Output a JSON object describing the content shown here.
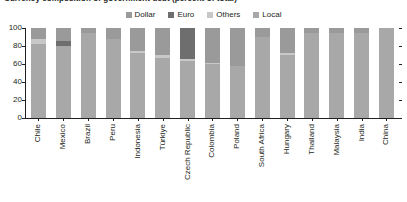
{
  "chart_title": "Currency composition of government debt (percent of total)",
  "legend": {
    "position": "top-center",
    "items": [
      {
        "label": "Dollar",
        "color": "#9a9a9a"
      },
      {
        "label": "Euro",
        "color": "#6e6e6e"
      },
      {
        "label": "Others",
        "color": "#c8c8c8"
      },
      {
        "label": "Local",
        "color": "#a8a8a8"
      }
    ]
  },
  "axes": {
    "yticks": [
      0,
      20,
      40,
      60,
      80,
      100
    ],
    "ylim": [
      0,
      100
    ],
    "ylabel": "",
    "xlabel": "",
    "grid": false
  },
  "chart_data": {
    "type": "bar",
    "title": "Currency composition of government debt (percent of total)",
    "subtype": "stacked-100-percent",
    "xlabel": "",
    "ylabel": "",
    "ylim": [
      0,
      100
    ],
    "yticks": [
      0,
      20,
      40,
      60,
      80,
      100
    ],
    "grid": false,
    "legend_position": "top-center",
    "stack_order_bottom_to_top": [
      "Local",
      "Others",
      "Euro",
      "Dollar"
    ],
    "categories": [
      "Chile",
      "Mexico",
      "Brazil",
      "Peru",
      "Indonesia",
      "Türkiye",
      "Czech Republic",
      "Colombia",
      "Poland",
      "South Africa",
      "Hungary",
      "Thailand",
      "Malaysia",
      "India",
      "China"
    ],
    "series": [
      {
        "name": "Local",
        "color": "#a8a8a8",
        "values": [
          82,
          80,
          95,
          88,
          72,
          67,
          63,
          60,
          58,
          90,
          70,
          95,
          94,
          95,
          100
        ]
      },
      {
        "name": "Others",
        "color": "#c8c8c8",
        "values": [
          6,
          0,
          0,
          0,
          2,
          3,
          3,
          1,
          0,
          0,
          2,
          0,
          0,
          0,
          0
        ]
      },
      {
        "name": "Euro",
        "color": "#6e6e6e",
        "values": [
          0,
          6,
          0,
          0,
          0,
          0,
          34,
          0,
          0,
          0,
          0,
          0,
          0,
          0,
          0
        ]
      },
      {
        "name": "Dollar",
        "color": "#9a9a9a",
        "values": [
          12,
          14,
          5,
          12,
          26,
          30,
          0,
          39,
          42,
          10,
          28,
          5,
          6,
          5,
          0
        ]
      }
    ]
  }
}
